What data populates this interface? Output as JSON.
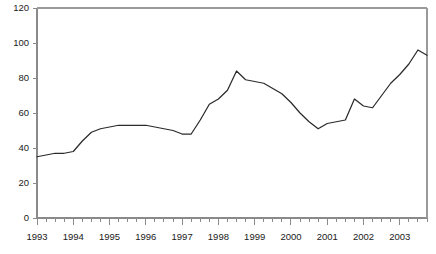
{
  "chart_data": {
    "type": "line",
    "title": "",
    "subtitle": "",
    "xlabel": "",
    "ylabel": "",
    "xlim": [
      1993.0,
      2003.75
    ],
    "ylim": [
      0,
      120
    ],
    "grid": false,
    "legend": null,
    "legend_position": "none",
    "line_color": "#2b2b2b",
    "axis_color": "#8a8a8a",
    "background_color": "#ffffff",
    "y_ticks": [
      0,
      20,
      40,
      60,
      80,
      100,
      120
    ],
    "y_tick_labels": [
      "0",
      "20",
      "40",
      "60",
      "80",
      "100",
      "120"
    ],
    "x_ticks": [
      1993,
      1994,
      1995,
      1996,
      1997,
      1998,
      1999,
      2000,
      2001,
      2002,
      2003
    ],
    "x_tick_labels": [
      "1993",
      "1994",
      "1995",
      "1996",
      "1997",
      "1998",
      "1999",
      "2000",
      "2001",
      "2002",
      "2003"
    ],
    "x_minor_ticks_per_interval": 4,
    "x": [
      1993.0,
      1993.25,
      1993.5,
      1993.75,
      1994.0,
      1994.25,
      1994.5,
      1994.75,
      1995.0,
      1995.25,
      1995.5,
      1995.75,
      1996.0,
      1996.25,
      1996.5,
      1996.75,
      1997.0,
      1997.25,
      1997.5,
      1997.75,
      1998.0,
      1998.25,
      1998.5,
      1998.75,
      1999.0,
      1999.25,
      1999.5,
      1999.75,
      2000.0,
      2000.25,
      2000.5,
      2000.75,
      2001.0,
      2001.25,
      2001.5,
      2001.75,
      2002.0,
      2002.25,
      2002.5,
      2002.75,
      2003.0,
      2003.25,
      2003.5,
      2003.75
    ],
    "series": [
      {
        "name": "series-1",
        "color": "#2b2b2b",
        "values": [
          35,
          36,
          37,
          37,
          38,
          44,
          49,
          51,
          52,
          53,
          53,
          53,
          53,
          52,
          51,
          50,
          48,
          48,
          56,
          65,
          68,
          73,
          84,
          79,
          78,
          77,
          74,
          71,
          66,
          60,
          55,
          51,
          54,
          55,
          56,
          68,
          64,
          63,
          70,
          77,
          82,
          88,
          96,
          93
        ]
      }
    ]
  },
  "axes": {
    "plot_left_px": 37,
    "plot_right_px": 427,
    "plot_top_px": 8,
    "plot_bottom_px": 218
  }
}
